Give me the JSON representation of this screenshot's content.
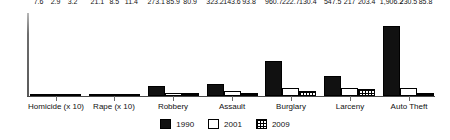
{
  "chart_data": {
    "type": "bar",
    "title": "",
    "subtitle": "",
    "xlabel": "",
    "ylabel": "",
    "grid": false,
    "legend_position": "bottom-center",
    "axis": {
      "y_visible": true,
      "y_tick_labels": [],
      "x_visible": true,
      "ylim": [
        0,
        1906.2
      ]
    },
    "categories": [
      "Homicide (x 10)",
      "Rape (x 10)",
      "Robbery",
      "Assault",
      "Burglary",
      "Larceny",
      "Auto Theft"
    ],
    "series": [
      {
        "name": "1990",
        "color": "#111111",
        "pattern": "solid",
        "values": [
          7.6,
          21.1,
          273.1,
          323.2,
          960.7,
          547.5,
          1906.2
        ],
        "labels": [
          "7.6",
          "21.1",
          "273.1",
          "323.2",
          "960.7",
          "547.5",
          "1,906.2"
        ]
      },
      {
        "name": "2001",
        "color": "#ffffff",
        "pattern": "empty",
        "values": [
          2.9,
          8.5,
          85.9,
          143.6,
          222.7,
          217.0,
          230.5
        ],
        "labels": [
          "2.9",
          "8.5",
          "85.9",
          "143.6",
          "222.7",
          "217",
          "230.5"
        ]
      },
      {
        "name": "2009",
        "color": "#ffffff",
        "pattern": "grid",
        "values": [
          3.2,
          11.4,
          80.9,
          93.8,
          130.4,
          203.4,
          85.8
        ],
        "labels": [
          "3.2",
          "11.4",
          "80.9",
          "93.8",
          "130.4",
          "203.4",
          "85.8"
        ]
      }
    ]
  },
  "legend": {
    "items": [
      {
        "label": "1990",
        "swatch": "solid-black-swatch"
      },
      {
        "label": "2001",
        "swatch": "empty-white-swatch"
      },
      {
        "label": "2009",
        "swatch": "grid-pattern-swatch"
      }
    ]
  }
}
